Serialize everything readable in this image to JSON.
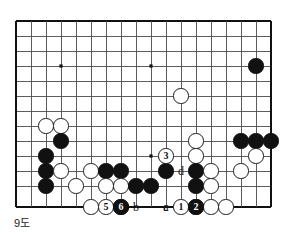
{
  "diagram": {
    "caption": "9도",
    "board": {
      "cols": 18,
      "rows": 13,
      "origin_x": 16,
      "origin_y": 21,
      "spacing": 15,
      "bottom_edge_y": 207,
      "line_color": "#4a4a4a",
      "edge_color": "#111111",
      "background": "#ffffff",
      "star_points": [
        {
          "col": 3,
          "row": 3
        },
        {
          "col": 9,
          "row": 3
        },
        {
          "col": 9,
          "row": 9
        }
      ]
    },
    "colors": {
      "black_stone": "#111111",
      "white_stone": "#ffffff",
      "white_stone_edge": "#1a1a1a",
      "label_text": "#111111"
    },
    "stones": [
      {
        "col": 16,
        "row": 3,
        "color": "black"
      },
      {
        "col": 11,
        "row": 5,
        "color": "white"
      },
      {
        "col": 2,
        "row": 7,
        "color": "white"
      },
      {
        "col": 3,
        "row": 7,
        "color": "white"
      },
      {
        "col": 3,
        "row": 8,
        "color": "black"
      },
      {
        "col": 2,
        "row": 9,
        "color": "black"
      },
      {
        "col": 12,
        "row": 8,
        "color": "white"
      },
      {
        "col": 15,
        "row": 8,
        "color": "black"
      },
      {
        "col": 17,
        "row": 8,
        "color": "black"
      },
      {
        "col": 16,
        "row": 8,
        "color": "black"
      },
      {
        "col": 12,
        "row": 9,
        "color": "white"
      },
      {
        "col": 16,
        "row": 9,
        "color": "white"
      },
      {
        "col": 2,
        "row": 10,
        "color": "black"
      },
      {
        "col": 3,
        "row": 10,
        "color": "white"
      },
      {
        "col": 5,
        "row": 10,
        "color": "white"
      },
      {
        "col": 6,
        "row": 10,
        "color": "black"
      },
      {
        "col": 7,
        "row": 10,
        "color": "black"
      },
      {
        "col": 10,
        "row": 10,
        "color": "black"
      },
      {
        "col": 12,
        "row": 10,
        "color": "black"
      },
      {
        "col": 13,
        "row": 10,
        "color": "white"
      },
      {
        "col": 15,
        "row": 10,
        "color": "white"
      },
      {
        "col": 2,
        "row": 11,
        "color": "black"
      },
      {
        "col": 4,
        "row": 11,
        "color": "white"
      },
      {
        "col": 6,
        "row": 11,
        "color": "white"
      },
      {
        "col": 7,
        "row": 11,
        "color": "white"
      },
      {
        "col": 8,
        "row": 11,
        "color": "black"
      },
      {
        "col": 9,
        "row": 11,
        "color": "black"
      },
      {
        "col": 12,
        "row": 11,
        "color": "black"
      },
      {
        "col": 13,
        "row": 11,
        "color": "white"
      },
      {
        "col": 5,
        "row": 12,
        "color": "white"
      },
      {
        "col": 12,
        "row": 12,
        "color": "black"
      },
      {
        "col": 13,
        "row": 12,
        "color": "white"
      },
      {
        "col": 14,
        "row": 12,
        "color": "white"
      }
    ],
    "numbered_moves": [
      {
        "number": "3",
        "col": 10,
        "row": 9,
        "color": "white"
      },
      {
        "number": "5",
        "col": 6,
        "row": 12,
        "color": "white"
      },
      {
        "number": "4",
        "col": 7,
        "row": 12,
        "color": "black"
      },
      {
        "number": "1",
        "col": 11,
        "row": 12,
        "color": "white"
      },
      {
        "number": "6",
        "col": 7,
        "row": 13,
        "color": "black"
      },
      {
        "number": "2",
        "col": 12,
        "row": 13,
        "color": "black"
      }
    ],
    "point_labels": [
      {
        "text": "d",
        "col": 11,
        "row": 10
      },
      {
        "text": "b",
        "col": 8,
        "row": 12
      },
      {
        "text": "a",
        "col": 10,
        "row": 12
      },
      {
        "text": "c",
        "col": 10,
        "row": 13
      }
    ]
  }
}
